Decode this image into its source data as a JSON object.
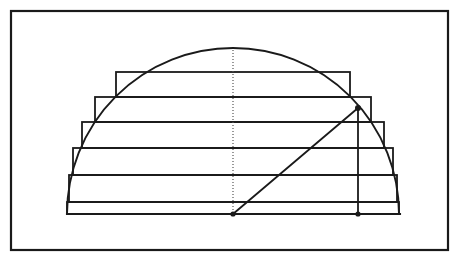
{
  "figure": {
    "canvas": {
      "width": 459,
      "height": 262,
      "background": "#ffffff"
    },
    "stroke_color": "#1a1a1a",
    "frame": {
      "label": "outer border",
      "x": 11,
      "y": 11,
      "width": 437,
      "height": 239,
      "stroke_width": 2.2
    },
    "semicircle": {
      "label": "semicircle arc",
      "center_x": 233,
      "center_y": 214,
      "radius": 166,
      "apex_y": 48,
      "left_x": 67,
      "right_x": 399,
      "stroke_width": 1.9
    },
    "baseline": {
      "label": "diameter baseline",
      "x1": 67,
      "y1": 214,
      "x2": 400,
      "y2": 214,
      "stroke_width": 2.1
    },
    "axis": {
      "label": "dotted vertical center axis",
      "x": 233,
      "y_top": 50,
      "y_bottom": 214,
      "dash": "1,2",
      "stroke_width": 1.2,
      "color": "#555555"
    },
    "radius_line": {
      "label": "diagonal radius",
      "x1": 233,
      "y1": 214,
      "x2": 358,
      "y2": 108,
      "stroke_width": 1.8
    },
    "height_line": {
      "label": "vertical from arc point to baseline",
      "x": 358,
      "y_top": 108,
      "y_bottom": 214,
      "stroke_width": 1.8
    },
    "points": [
      {
        "name": "center-point",
        "x": 233,
        "y": 214,
        "r": 2.6
      },
      {
        "name": "foot-point",
        "x": 358,
        "y": 214,
        "r": 2.6
      },
      {
        "name": "arc-point",
        "x": 358,
        "y": 108,
        "r": 3.0
      }
    ],
    "rectangles": [
      {
        "index": 1,
        "left": 116,
        "right": 350,
        "top": 72,
        "bottom": 97,
        "label": "rect-1-top"
      },
      {
        "index": 2,
        "left": 95,
        "right": 371,
        "top": 97,
        "bottom": 122,
        "label": "rect-2"
      },
      {
        "index": 3,
        "left": 82,
        "right": 384,
        "top": 122,
        "bottom": 148,
        "label": "rect-3"
      },
      {
        "index": 4,
        "left": 73,
        "right": 393,
        "top": 148,
        "bottom": 175,
        "label": "rect-4"
      },
      {
        "index": 5,
        "left": 69,
        "right": 397,
        "top": 175,
        "bottom": 202,
        "label": "rect-5"
      },
      {
        "index": 6,
        "left": 67,
        "right": 399,
        "top": 202,
        "bottom": 214,
        "label": "rect-6-base"
      }
    ],
    "rect_stroke_width": 1.8,
    "step_count": 6
  }
}
